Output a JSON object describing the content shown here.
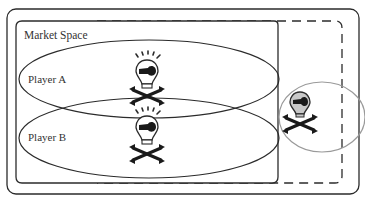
{
  "diagram": {
    "market_space_label": "Market Space",
    "players": [
      {
        "label": "Player A",
        "icon": "pirate-bulb-icon"
      },
      {
        "label": "Player B",
        "icon": "pirate-bulb-icon"
      }
    ],
    "outsider": {
      "icon": "pirate-bulb-icon",
      "shade": "gray"
    },
    "colors": {
      "line": "#2b2b2b",
      "outsider_ellipse": "#9a9a9a",
      "outsider_bulb_fill": "#c8c8c8"
    }
  }
}
